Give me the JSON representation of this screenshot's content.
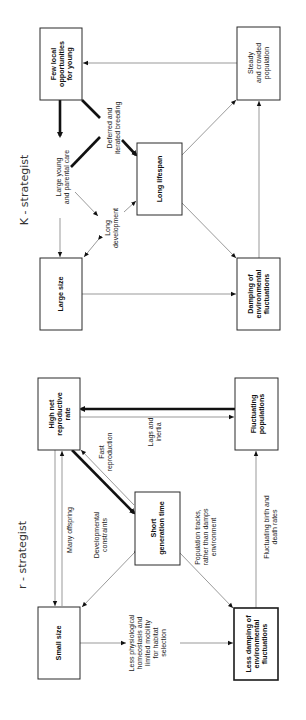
{
  "k_diagram": {
    "title": "K - strategist",
    "boxes": {
      "few_local": [
        "Few local",
        "opportunities",
        "for young"
      ],
      "steady": [
        "Steady",
        "and crowded",
        "population"
      ],
      "long_lifespan": [
        "Long lifespan"
      ],
      "large_size": [
        "Large size"
      ],
      "damping": [
        "Damping of",
        "environmental",
        "fluctuations"
      ]
    },
    "labels": {
      "large_young": [
        "Large young",
        "and parental care"
      ],
      "deferred": [
        "Deferred and",
        "iterated breeding"
      ],
      "long_development": [
        "Long",
        "development"
      ]
    }
  },
  "r_diagram": {
    "title": "r - strategist",
    "boxes": {
      "high_net": [
        "High net",
        "reproductive",
        "rate"
      ],
      "fluctuating": [
        "Fluctuating",
        "populations"
      ],
      "short_gen": [
        "Short",
        "generation time"
      ],
      "small_size": [
        "Small size"
      ],
      "less_damping": [
        "Less damping of",
        "environmental",
        "fluctuations"
      ]
    },
    "labels": {
      "many_offspring": [
        "Many offspring"
      ],
      "fast_reproduction": [
        "Fast",
        "reproduction"
      ],
      "lags_inertia": [
        "Lags and",
        "inertia"
      ],
      "developmental": [
        "Developmental",
        "constraints"
      ],
      "population_tracks": [
        "Population tracks,",
        "rather than damps",
        "environment"
      ],
      "fluct_birth": [
        "Fluctuating birth and",
        "death rates"
      ],
      "less_physio": [
        "Less physiological",
        "homeostasis and",
        "limited mobility",
        "for habitat",
        "selection"
      ]
    }
  },
  "colors": {
    "ink": "#1a1a1a",
    "thin_line": "#555555",
    "background": "#ffffff"
  }
}
